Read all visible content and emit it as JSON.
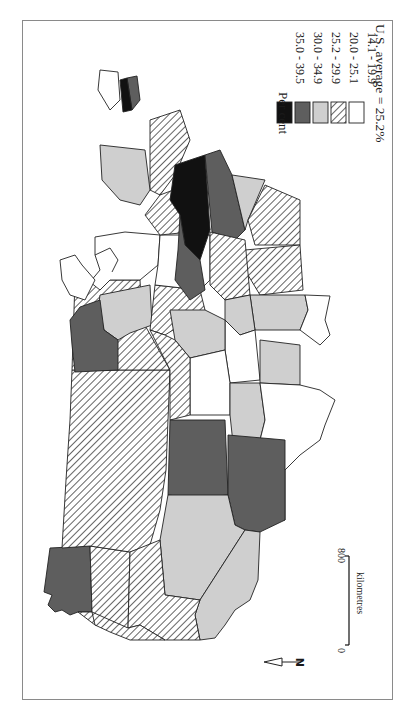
{
  "map": {
    "subject": "Per cent by U.S. state (choropleth, rotated 90°, north at left)",
    "orientation": "north-left",
    "fills": {
      "black": "#111111",
      "dark": "#5e5e5e",
      "light": "#cfcfcf",
      "hatched": "hatch",
      "white": "#ffffff"
    }
  },
  "legend": {
    "title": "Per cent",
    "items": [
      {
        "range": "35.0 - 39.5",
        "fill": "black"
      },
      {
        "range": "30.0 - 34.9",
        "fill": "dark"
      },
      {
        "range": "25.2 - 29.9",
        "fill": "light"
      },
      {
        "range": "20.0 - 25.1",
        "fill": "hatched"
      },
      {
        "range": "14.1 - 19.9",
        "fill": "white"
      }
    ],
    "average": "U.S. average = 25.2%"
  },
  "scale": {
    "max_label": "800",
    "min_label": "0",
    "unit": "kilometres"
  },
  "north_arrow": {
    "label": "N"
  }
}
